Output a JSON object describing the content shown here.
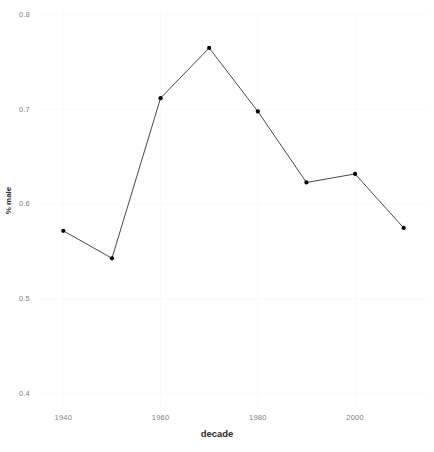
{
  "chart_data": {
    "type": "line",
    "title": "",
    "xlabel": "decade",
    "ylabel": "% male",
    "x": [
      1940,
      1950,
      1960,
      1970,
      1980,
      1990,
      2000,
      2010
    ],
    "values": [
      0.572,
      0.543,
      0.712,
      0.765,
      0.698,
      0.623,
      0.632,
      0.575
    ],
    "series": [
      {
        "name": "% male",
        "values": [
          0.572,
          0.543,
          0.712,
          0.765,
          0.698,
          0.623,
          0.632,
          0.575
        ]
      }
    ],
    "xlim": [
      1935,
      2015
    ],
    "ylim": [
      0.385,
      0.805
    ],
    "xticks": [
      1940,
      1960,
      1980,
      2000
    ],
    "xtick_labels": [
      "1940",
      "1960",
      "1980",
      "2000"
    ],
    "yticks": [
      0.4,
      0.5,
      0.6,
      0.7,
      0.8
    ],
    "ytick_labels": [
      "0.4",
      "0.5",
      "0.6",
      "0.7",
      "0.8"
    ],
    "grid": true,
    "grid_color": "#fafafa",
    "legend": "none",
    "line_color": "#333333",
    "point_color": "#000000",
    "panel_background": "#ffffff",
    "tick_label_color": "#7f7f7f",
    "axis_title_color": "#2b2b2b"
  },
  "axes": {
    "x_title": "decade",
    "y_title": "% male",
    "x_tick_labels": [
      "1940",
      "1960",
      "1980",
      "2000"
    ],
    "y_tick_labels": [
      "0.4",
      "0.5",
      "0.6",
      "0.7",
      "0.8"
    ]
  }
}
